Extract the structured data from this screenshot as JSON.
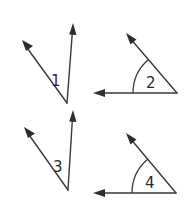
{
  "diagram": {
    "title": "",
    "stroke_color": "#3a3a3a",
    "background": "#ffffff",
    "angles": [
      {
        "id": 1,
        "label": "1",
        "vertex": [
          67,
          103
        ],
        "ray_a_tip": [
          22,
          40
        ],
        "ray_b_tip": [
          73,
          23
        ],
        "arc": false,
        "label_pos": [
          51,
          80
        ]
      },
      {
        "id": 2,
        "label": "2",
        "vertex": [
          177,
          93
        ],
        "ray_a_tip": [
          93,
          93
        ],
        "ray_b_tip": [
          126,
          33
        ],
        "arc": true,
        "label_pos": [
          146,
          87
        ]
      },
      {
        "id": 3,
        "label": "3",
        "vertex": [
          68,
          190
        ],
        "ray_a_tip": [
          24,
          127
        ],
        "ray_b_tip": [
          73,
          110
        ],
        "arc": false,
        "label_pos": [
          53,
          166
        ]
      },
      {
        "id": 4,
        "label": "4",
        "vertex": [
          176,
          193
        ],
        "ray_a_tip": [
          93,
          193
        ],
        "ray_b_tip": [
          126,
          133
        ],
        "arc": true,
        "label_pos": [
          145,
          187
        ]
      }
    ]
  }
}
